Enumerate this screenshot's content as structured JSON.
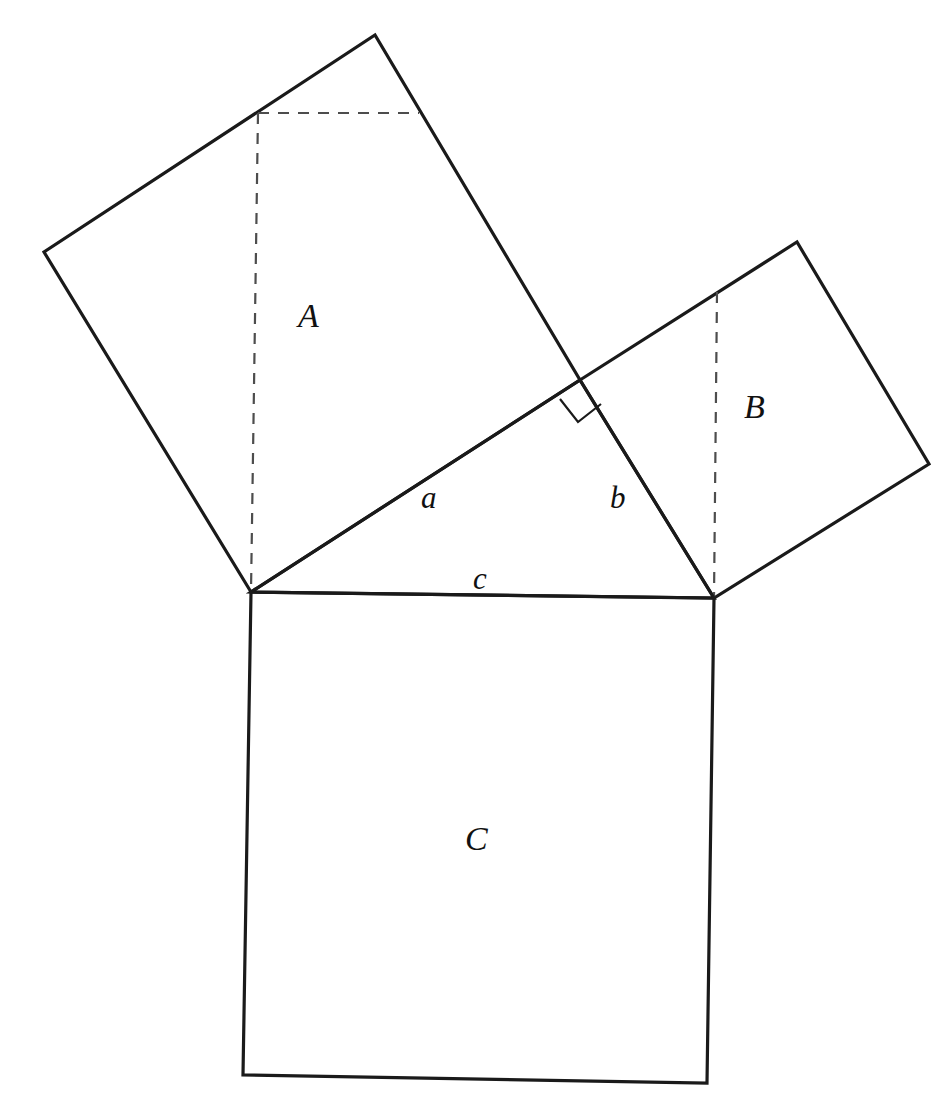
{
  "figure": {
    "background_color": "#ffffff",
    "stroke_color": "#1a1a1a",
    "dashed_stroke_color": "#4d4d4d",
    "width": 952,
    "height": 1111
  },
  "labels": {
    "square_a": "A",
    "square_b": "B",
    "square_c": "C",
    "side_a": "a",
    "side_b": "b",
    "side_c": "c"
  },
  "label_positions": {
    "square_a": {
      "x": 298,
      "y": 299
    },
    "square_b": {
      "x": 744,
      "y": 390
    },
    "square_c": {
      "x": 465,
      "y": 822
    },
    "side_a": {
      "x": 421,
      "y": 482
    },
    "side_b": {
      "x": 610,
      "y": 482
    },
    "side_c": {
      "x": 473,
      "y": 563
    }
  },
  "geometry": {
    "triangle": {
      "name": "right-triangle",
      "vertices": {
        "left": {
          "x": 251,
          "y": 592
        },
        "right": {
          "x": 714,
          "y": 598
        },
        "apex": {
          "x": 580,
          "y": 380
        }
      },
      "right_angle_at": "apex",
      "points": "251,592 580,380 714,598"
    },
    "square_a": {
      "name": "square-on-side-a",
      "points": "251,592 44,252 375,35 580,380",
      "side_label": "a"
    },
    "square_b": {
      "name": "square-on-side-b",
      "points": "580,380 797,242 929,464 714,598",
      "side_label": "b"
    },
    "square_c": {
      "name": "square-on-side-c",
      "points": "251,592 714,598 707,1083 243,1075",
      "side_label": "c"
    },
    "dashed_a_vertical": {
      "from": {
        "x": 258,
        "y": 113
      },
      "to": {
        "x": 251,
        "y": 592
      }
    },
    "dashed_a_horizontal": {
      "from": {
        "x": 258,
        "y": 113
      },
      "to": {
        "x": 419,
        "y": 113
      }
    },
    "dashed_b_vertical": {
      "from": {
        "x": 717,
        "y": 292
      },
      "to": {
        "x": 714,
        "y": 598
      }
    },
    "right_angle_marker": {
      "points": "560,399 578,422 601,404",
      "size": 29
    }
  }
}
